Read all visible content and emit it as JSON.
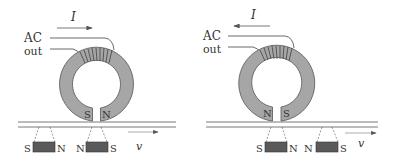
{
  "figure": {
    "colors": {
      "ring_fill": "#a6a6a6",
      "magnet_fill": "#5a5a5a",
      "stroke": "#444444",
      "background": "#ffffff"
    },
    "panels": [
      {
        "id": "left",
        "current_label": "I",
        "current_direction": "right",
        "source_label_line1": "AC",
        "source_label_line2": "out",
        "head_pole_left": "S",
        "head_pole_right": "N",
        "velocity_label": "v",
        "velocity_direction": "right",
        "magnets": [
          {
            "left_pole": "S",
            "right_pole": "N"
          },
          {
            "left_pole": "N",
            "right_pole": "S"
          }
        ]
      },
      {
        "id": "right",
        "current_label": "I",
        "current_direction": "left",
        "source_label_line1": "AC",
        "source_label_line2": "out",
        "head_pole_left": "N",
        "head_pole_right": "S",
        "velocity_label": "v",
        "velocity_direction": "right",
        "magnets": [
          {
            "left_pole": "S",
            "right_pole": "N"
          },
          {
            "left_pole": "N",
            "right_pole": "S"
          }
        ]
      }
    ]
  }
}
